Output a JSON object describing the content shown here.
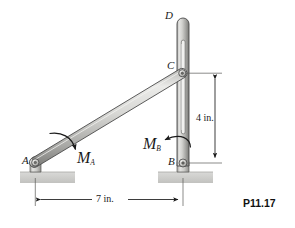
{
  "figure": {
    "tag": "P11.17",
    "points": {
      "a": "A",
      "b": "B",
      "c": "C",
      "d": "D"
    },
    "moments": {
      "ma_label": "M",
      "ma_sub": "A",
      "mb_label": "M",
      "mb_sub": "B"
    },
    "dimensions": {
      "horizontal": "7 in.",
      "vertical": "4 in."
    },
    "colors": {
      "bar_light": "#e2e2e0",
      "bar_mid": "#c9c9c6",
      "bar_dark": "#8e8e8b",
      "outline": "#4a4a4a",
      "ground": "#cfcfcd",
      "ink": "#1a1a1a"
    }
  }
}
